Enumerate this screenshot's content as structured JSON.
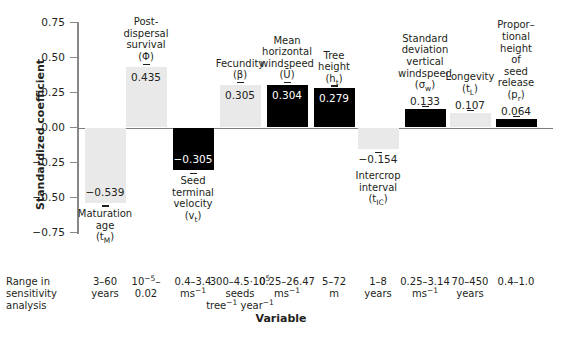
{
  "chart_data": {
    "type": "bar",
    "title": "",
    "xlabel": "Variable",
    "ylabel": "Standardized coefficient",
    "ylim": [
      -0.75,
      0.75
    ],
    "ytick_labels": [
      "0.75",
      "0.50",
      "0.25",
      "0.00",
      "-0.25",
      "-0.50",
      "-0.75"
    ],
    "ytick_values": [
      0.75,
      0.5,
      0.25,
      0,
      -0.25,
      -0.5,
      -0.75
    ],
    "grid": false,
    "legend": "none",
    "categories": [
      "Maturation age (t_M)",
      "Post-dispersal survival (Φ)",
      "Seed terminal velocity (v_t)",
      "Fecundity (β)",
      "Mean horizontal windspeed (Ū)",
      "Tree height (h_t)",
      "Intercrop interval (t_IC)",
      "Standard deviation vertical windspeed (σ_w)",
      "Longevity (t_L)",
      "Proportional height of seed release (p_r)"
    ],
    "values": [
      -0.539,
      0.435,
      -0.305,
      0.305,
      0.304,
      0.279,
      -0.154,
      0.133,
      0.107,
      0.064
    ],
    "bar_colors": [
      "light",
      "light",
      "dark",
      "light",
      "dark",
      "dark",
      "light",
      "dark",
      "light",
      "dark"
    ],
    "value_labels": [
      "−0.539",
      "0.435",
      "−0.305",
      "0.305",
      "0.304",
      "0.279",
      "−0.154",
      "0.133",
      "0.107",
      "0.064"
    ]
  },
  "axis": {
    "y_title": "Standardized coefficient",
    "x_title": "Variable",
    "ticks": [
      "0.75",
      "0.50",
      "0.25",
      "0.00",
      "−0.25",
      "−0.50",
      "−0.75"
    ]
  },
  "bars": [
    {
      "id": "maturation-age",
      "value_label": "−0.539",
      "name_lines": [
        "Maturation",
        "age"
      ],
      "symbol_html": "(t<sub>M</sub>)",
      "fill": "light"
    },
    {
      "id": "post-dispersal-survival",
      "value_label": "0.435",
      "name_lines": [
        "Post-",
        "dispersal",
        "survival"
      ],
      "symbol_html": "(Φ)",
      "fill": "light"
    },
    {
      "id": "seed-terminal-velocity",
      "value_label": "−0.305",
      "name_lines": [
        "Seed",
        "terminal",
        "velocity"
      ],
      "symbol_html": "(v<sub>t</sub>)",
      "fill": "dark"
    },
    {
      "id": "fecundity",
      "value_label": "0.305",
      "name_lines": [
        "Fecundity"
      ],
      "symbol_html": "(β)",
      "fill": "light"
    },
    {
      "id": "mean-horizontal-windspeed",
      "value_label": "0.304",
      "name_lines": [
        "Mean",
        "horizontal",
        "windspeed"
      ],
      "symbol_html": "(Ū)",
      "fill": "dark"
    },
    {
      "id": "tree-height",
      "value_label": "0.279",
      "name_lines": [
        "Tree",
        "height"
      ],
      "symbol_html": "(h<sub>t</sub>)",
      "fill": "dark"
    },
    {
      "id": "intercrop-interval",
      "value_label": "−0.154",
      "name_lines": [
        "Intercrop",
        "interval"
      ],
      "symbol_html": "(t<sub>IC</sub>)",
      "fill": "light"
    },
    {
      "id": "sd-vertical-windspeed",
      "value_label": "0.133",
      "name_lines": [
        "Standard",
        "deviation",
        "vertical",
        "windspeed"
      ],
      "symbol_html": "(σ<sub>w</sub>)",
      "fill": "dark"
    },
    {
      "id": "longevity",
      "value_label": "0.107",
      "name_lines": [
        "Longevity"
      ],
      "symbol_html": "(t<sub>L</sub>)",
      "fill": "light"
    },
    {
      "id": "proportional-height-seed-release",
      "value_label": "0.064",
      "name_lines": [
        "Propor–",
        "tional",
        "height",
        "of",
        "seed",
        "release"
      ],
      "symbol_html": "(p<sub>r</sub>)",
      "fill": "dark"
    }
  ],
  "range_row": {
    "header_lines": [
      "Range in",
      "sensitivity",
      "analysis"
    ],
    "cells_html": [
      "3–60<br>years",
      "10<sup>−5</sup>–<br>0.02",
      "0.4–3.4<br>ms<sup>−1</sup>",
      "300–4.5·10<sup>5</sup><br>seeds<br>tree<sup>−1</sup> year<sup>−1</sup>",
      "0.25–26.47<br>ms<sup>−1</sup>",
      "5–72<br>m",
      "1–8<br>years",
      "0.25–3.14<br>ms<sup>−1</sup>",
      "70–450<br>years",
      "0.4–1.0"
    ]
  },
  "colors": {
    "light_bar": "#e9e9e9",
    "dark_bar": "#000000",
    "axis": "#888888",
    "text": "#231f20"
  }
}
